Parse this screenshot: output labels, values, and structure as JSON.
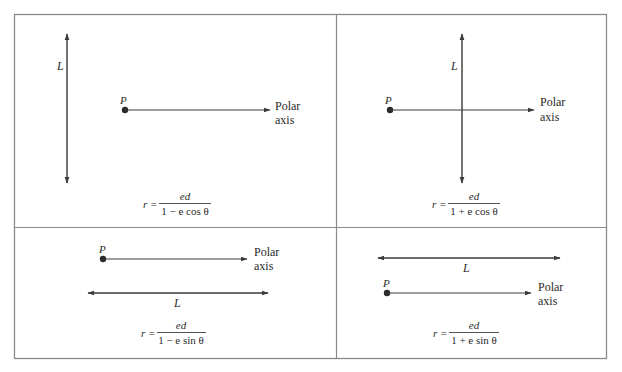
{
  "figure": {
    "colors": {
      "frame": "#8a8a8a",
      "line": "#3a3a3a",
      "text": "#2a2a2a",
      "background": "#ffffff"
    }
  },
  "panels": [
    {
      "id": "top-left",
      "point_label": "P",
      "directrix_label": "L",
      "directrix_orientation": "vertical",
      "directrix_position": "left of P",
      "axis_label_line1": "Polar",
      "axis_label_line2": "axis",
      "formula": {
        "lhs": "r =",
        "numerator": "ed",
        "denominator": "1 − e cos θ"
      }
    },
    {
      "id": "top-right",
      "point_label": "P",
      "directrix_label": "L",
      "directrix_orientation": "vertical",
      "directrix_position": "right of P",
      "axis_label_line1": "Polar",
      "axis_label_line2": "axis",
      "formula": {
        "lhs": "r =",
        "numerator": "ed",
        "denominator": "1 + e cos θ"
      }
    },
    {
      "id": "bottom-left",
      "point_label": "P",
      "directrix_label": "L",
      "directrix_orientation": "horizontal",
      "directrix_position": "below P",
      "axis_label_line1": "Polar",
      "axis_label_line2": "axis",
      "formula": {
        "lhs": "r =",
        "numerator": "ed",
        "denominator": "1 − e sin θ"
      }
    },
    {
      "id": "bottom-right",
      "point_label": "P",
      "directrix_label": "L",
      "directrix_orientation": "horizontal",
      "directrix_position": "above P",
      "axis_label_line1": "Polar",
      "axis_label_line2": "axis",
      "formula": {
        "lhs": "r =",
        "numerator": "ed",
        "denominator": "1 + e sin θ"
      }
    }
  ]
}
